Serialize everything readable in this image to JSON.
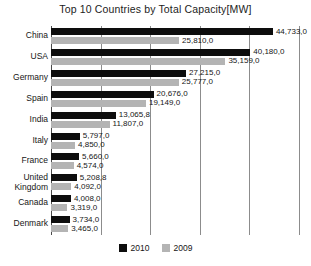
{
  "chart_data": {
    "type": "bar",
    "orientation": "horizontal",
    "title": "Top 10 Countries by Total Capacity[MW]",
    "xlabel": "",
    "ylabel": "",
    "xlim": [
      0,
      50000
    ],
    "gridlines": [
      10000,
      20000,
      30000,
      40000,
      50000
    ],
    "grid": true,
    "legend_position": "bottom",
    "categories": [
      "China",
      "USA",
      "Germany",
      "Spain",
      "India",
      "Italy",
      "France",
      "United\nKingdom",
      "Canada",
      "Denmark"
    ],
    "series": [
      {
        "name": "2010",
        "color": "#0d0d0d",
        "values": [
          44733.0,
          40180.0,
          27215.0,
          20676.0,
          13065.8,
          5797.0,
          5660.0,
          5208.8,
          4008.0,
          3734.0
        ],
        "labels": [
          "44,733,0",
          "40,180,0",
          "27,215,0",
          "20,676,0",
          "13,065,8",
          "5,797,0",
          "5,660,0",
          "5,208,8",
          "4,008,0",
          "3,734,0"
        ]
      },
      {
        "name": "2009",
        "color": "#b4b4b4",
        "values": [
          25810.0,
          35159.0,
          25777.0,
          19149.0,
          11807.0,
          4850.0,
          4574.0,
          4092.0,
          3319.0,
          3465.0
        ],
        "labels": [
          "25,810,0",
          "35,159,0",
          "25,777,0",
          "19,149,0",
          "11,807,0",
          "4,850,0",
          "4,574,0",
          "4,092,0",
          "3,319,0",
          "3,465,0"
        ]
      }
    ]
  },
  "legend": {
    "items": [
      {
        "label": "2010",
        "swatch_class": "s2010"
      },
      {
        "label": "2009",
        "swatch_class": "s2009"
      }
    ]
  }
}
